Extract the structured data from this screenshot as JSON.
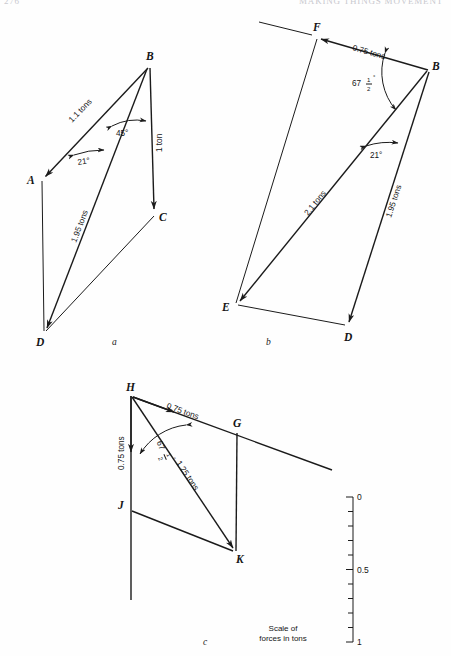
{
  "page": {
    "running_head_left": "276",
    "running_head_right": "MAKING THINGS MOVEMENT"
  },
  "figures": [
    {
      "id": "a",
      "caption": "a",
      "vertices": [
        {
          "name": "A",
          "x": 41,
          "y": 180
        },
        {
          "name": "B",
          "x": 148,
          "y": 68
        },
        {
          "name": "C",
          "x": 155,
          "y": 214
        },
        {
          "name": "D",
          "x": 44,
          "y": 332
        }
      ],
      "force_labels": [
        {
          "text": "1.1 tons",
          "x": 72,
          "y": 123
        },
        {
          "text": "1 ton",
          "x": 160,
          "y": 150
        },
        {
          "text": "1.95 tons",
          "x": 80,
          "y": 240
        }
      ],
      "angles": [
        {
          "text": "45°",
          "x": 124,
          "y": 132
        },
        {
          "text": "21°",
          "x": 87,
          "y": 161
        }
      ]
    },
    {
      "id": "b",
      "caption": "b",
      "vertices": [
        {
          "name": "F",
          "x": 317,
          "y": 37
        },
        {
          "name": "B",
          "x": 428,
          "y": 70
        },
        {
          "name": "E",
          "x": 236,
          "y": 304
        },
        {
          "name": "D",
          "x": 348,
          "y": 327
        }
      ],
      "force_labels": [
        {
          "text": "0.75 tons",
          "x": 372,
          "y": 45
        },
        {
          "text": "2.1 tons",
          "x": 318,
          "y": 208
        },
        {
          "text": "1.95 tons",
          "x": 394,
          "y": 210
        }
      ],
      "angles": [
        {
          "text": "67",
          "fraction_num": "1",
          "fraction_den": "2",
          "degree": "°",
          "x": 366,
          "y": 82
        },
        {
          "text": "21°",
          "x": 380,
          "y": 148
        }
      ]
    },
    {
      "id": "c",
      "caption": "c",
      "vertices": [
        {
          "name": "H",
          "x": 131,
          "y": 396
        },
        {
          "name": "G",
          "x": 237,
          "y": 432
        },
        {
          "name": "J",
          "x": 131,
          "y": 510
        },
        {
          "name": "K",
          "x": 235,
          "y": 552
        }
      ],
      "force_labels": [
        {
          "text": "0.75 tons",
          "x": 182,
          "y": 410
        },
        {
          "text": "0.75 tons",
          "x": 120,
          "y": 452
        },
        {
          "text": "1.25 tons",
          "x": 190,
          "y": 470
        }
      ],
      "angles": [
        {
          "text": "67",
          "fraction_num": "1",
          "fraction_den": "2",
          "degree": "°",
          "x": 168,
          "y": 448
        }
      ]
    }
  ],
  "scale": {
    "caption_line1": "Scale of",
    "caption_line2": "forces in tons",
    "ticks": [
      {
        "value": "0",
        "major": true
      },
      {
        "value": "",
        "major": false
      },
      {
        "value": "",
        "major": false
      },
      {
        "value": "",
        "major": false
      },
      {
        "value": "",
        "major": false
      },
      {
        "value": "0.5",
        "major": true
      },
      {
        "value": "",
        "major": false
      },
      {
        "value": "",
        "major": false
      },
      {
        "value": "",
        "major": false
      },
      {
        "value": "",
        "major": false
      },
      {
        "value": "1",
        "major": true
      }
    ],
    "top_y": 497,
    "bottom_y": 642,
    "axis_x": 353
  },
  "colors": {
    "ink": "#1b1b1b",
    "paper": "#fefefe",
    "faint_head": "#c9c9cf"
  }
}
